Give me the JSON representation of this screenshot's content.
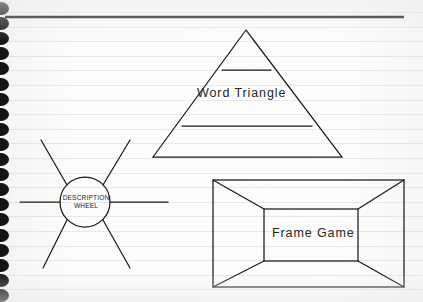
{
  "page": {
    "medium": "spiral-bound ruled notebook page (scanned)",
    "background_color": "#fbfbfa",
    "ink_color": "#1b1b1b",
    "rule_line_color": "#c4cad0",
    "spiral_hole_color": "#141414",
    "spiral_hole_count": 20
  },
  "header_rule": {
    "name": "top-horizontal-rule",
    "x1": 5,
    "y1": 17,
    "x2": 404,
    "y2": 17,
    "thickness": 2.4
  },
  "diagrams": [
    {
      "id": "word-triangle",
      "type": "triangle",
      "label": "Word Triangle",
      "label_position": "middle-band",
      "apex": {
        "x": 246,
        "y": 30
      },
      "base_left": {
        "x": 153,
        "y": 157
      },
      "base_right": {
        "x": 342,
        "y": 157
      },
      "divider_lines": [
        {
          "y": 70,
          "x1": 222,
          "x2": 271
        },
        {
          "y": 126,
          "x1": 182,
          "x2": 312
        }
      ],
      "band_count": 3
    },
    {
      "id": "description-wheel",
      "type": "wheel",
      "label_lines": [
        "DESCRIPTION",
        "WHEEL"
      ],
      "center": {
        "x": 85,
        "y": 202
      },
      "radius": 25,
      "spoke_count": 6,
      "spokes": [
        {
          "name": "spoke-west",
          "x1": 20,
          "y1": 202,
          "x2": 60,
          "y2": 202
        },
        {
          "name": "spoke-east",
          "x1": 110,
          "y1": 202,
          "x2": 168,
          "y2": 202
        },
        {
          "name": "spoke-northwest",
          "x1": 67,
          "y1": 185,
          "x2": 41,
          "y2": 140
        },
        {
          "name": "spoke-northeast",
          "x1": 103,
          "y1": 185,
          "x2": 130,
          "y2": 140
        },
        {
          "name": "spoke-southwest",
          "x1": 67,
          "y1": 220,
          "x2": 43,
          "y2": 268
        },
        {
          "name": "spoke-southeast",
          "x1": 103,
          "y1": 220,
          "x2": 130,
          "y2": 268
        }
      ]
    },
    {
      "id": "frame-game",
      "type": "nested-frame",
      "label": "Frame Game",
      "outer_rect": {
        "x": 213,
        "y": 180,
        "width": 191,
        "height": 107
      },
      "inner_rect": {
        "x": 264,
        "y": 209,
        "width": 94,
        "height": 52
      },
      "corner_connectors": [
        {
          "name": "connector-top-left",
          "x1": 213,
          "y1": 180,
          "x2": 264,
          "y2": 209
        },
        {
          "name": "connector-top-right",
          "x1": 404,
          "y1": 180,
          "x2": 358,
          "y2": 209
        },
        {
          "name": "connector-bottom-left",
          "x1": 213,
          "y1": 287,
          "x2": 264,
          "y2": 261
        },
        {
          "name": "connector-bottom-right",
          "x1": 404,
          "y1": 287,
          "x2": 358,
          "y2": 261
        }
      ]
    }
  ]
}
